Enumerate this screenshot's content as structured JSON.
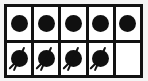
{
  "figure": {
    "type": "ten-frame",
    "rows": 2,
    "columns": 5,
    "total_cells": 10,
    "filled_cells": 9,
    "empty_cells": 1,
    "colors": {
      "counter": "#101010",
      "grid_line": "#121212",
      "cell_background": "#ffffff",
      "page_background": "#f4f4f4"
    },
    "grid": [
      {
        "row_name": "top-row",
        "cells": [
          {
            "name": "cell-r1c1",
            "counter": "plain-dot",
            "filled": true,
            "label": ""
          },
          {
            "name": "cell-r1c2",
            "counter": "plain-dot",
            "filled": true,
            "label": ""
          },
          {
            "name": "cell-r1c3",
            "counter": "plain-dot",
            "filled": true,
            "label": ""
          },
          {
            "name": "cell-r1c4",
            "counter": "plain-dot",
            "filled": true,
            "label": ""
          },
          {
            "name": "cell-r1c5",
            "counter": "plain-dot",
            "filled": true,
            "label": ""
          }
        ]
      },
      {
        "row_name": "bottom-row",
        "cells": [
          {
            "name": "cell-r2c1",
            "counter": "stemmed-dot",
            "filled": true,
            "label": ""
          },
          {
            "name": "cell-r2c2",
            "counter": "stemmed-dot",
            "filled": true,
            "label": ""
          },
          {
            "name": "cell-r2c3",
            "counter": "stemmed-dot",
            "filled": true,
            "label": ""
          },
          {
            "name": "cell-r2c4",
            "counter": "stemmed-dot",
            "filled": true,
            "label": ""
          },
          {
            "name": "cell-r2c5",
            "counter": "none",
            "filled": false,
            "label": ""
          }
        ]
      }
    ]
  }
}
